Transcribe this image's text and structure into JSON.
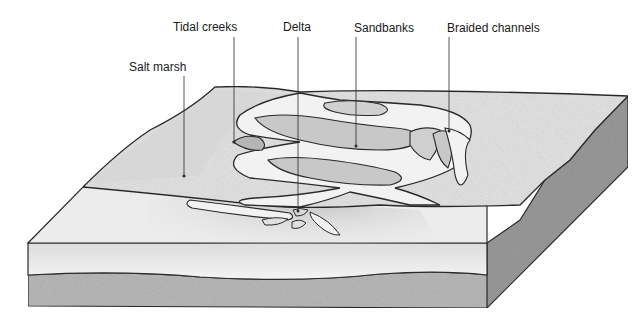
{
  "diagram": {
    "labels": [
      {
        "id": "tidal-creeks",
        "text": "Tidal creeks",
        "x": 173,
        "y": 20
      },
      {
        "id": "delta",
        "text": "Delta",
        "x": 296,
        "y": 20
      },
      {
        "id": "sandbanks",
        "text": "Sandbanks",
        "x": 354,
        "y": 21
      },
      {
        "id": "braided-channels",
        "text": "Braided channels",
        "x": 447,
        "y": 21
      },
      {
        "id": "salt-marsh",
        "text": "Salt marsh",
        "x": 129,
        "y": 60
      }
    ],
    "colors": {
      "outline": "#2a2a2a",
      "land": "#e4e4e4",
      "marsh": "#d6d6d6",
      "sandbank": "#c8c8c8",
      "channel": "#f2f2f2",
      "water": "#efefef",
      "sediment": "#b9b9b9",
      "side": "#9a9a9a"
    }
  }
}
